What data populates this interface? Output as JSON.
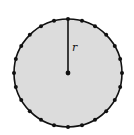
{
  "diagram": {
    "type": "circle-with-radius",
    "center": [
      68,
      73
    ],
    "radius": 54,
    "fill": "#dcdcdc",
    "stroke": "#111111",
    "radius_label": "r",
    "perimeter_points": 24
  }
}
